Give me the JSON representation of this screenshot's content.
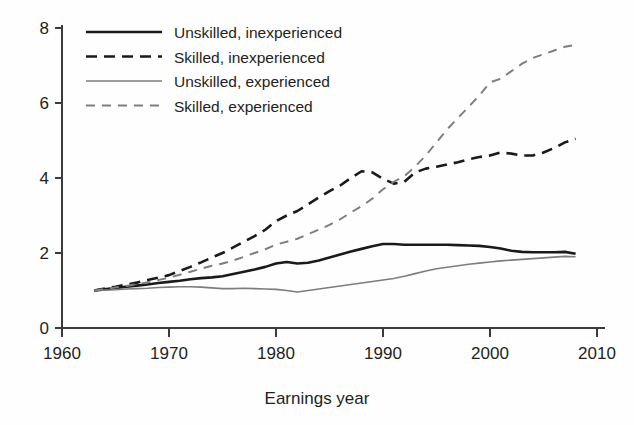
{
  "chart_data": {
    "type": "line",
    "title": "",
    "subtitle": "",
    "xlabel": "Earnings year",
    "ylabel": "",
    "xlim": [
      1960,
      2010
    ],
    "ylim": [
      0,
      8
    ],
    "xticks": [
      1960,
      1970,
      1980,
      1990,
      2000,
      2010
    ],
    "yticks": [
      0,
      2,
      4,
      6,
      8
    ],
    "xtick_labels": [
      "1960",
      "1970",
      "1980",
      "1990",
      "2000",
      "2010"
    ],
    "ytick_labels": [
      "0",
      "2",
      "4",
      "6",
      "8"
    ],
    "grid": false,
    "legend_position": "top-left",
    "annotations": [],
    "series": [
      {
        "name": "Unskilled, inexperienced",
        "color": "#1a1a1a",
        "width": 2.6,
        "dash": "none",
        "x": [
          1963,
          1964,
          1965,
          1966,
          1967,
          1968,
          1969,
          1970,
          1971,
          1972,
          1973,
          1974,
          1975,
          1976,
          1977,
          1978,
          1979,
          1980,
          1981,
          1982,
          1983,
          1984,
          1985,
          1986,
          1987,
          1988,
          1989,
          1990,
          1991,
          1992,
          1993,
          1994,
          1995,
          1996,
          1997,
          1998,
          1999,
          2000,
          2001,
          2002,
          2003,
          2004,
          2005,
          2006,
          2007,
          2008
        ],
        "values": [
          1.0,
          1.03,
          1.07,
          1.1,
          1.13,
          1.16,
          1.2,
          1.23,
          1.26,
          1.3,
          1.33,
          1.35,
          1.38,
          1.44,
          1.5,
          1.56,
          1.63,
          1.72,
          1.76,
          1.72,
          1.74,
          1.8,
          1.88,
          1.96,
          2.04,
          2.11,
          2.18,
          2.24,
          2.24,
          2.22,
          2.22,
          2.22,
          2.22,
          2.22,
          2.21,
          2.2,
          2.19,
          2.16,
          2.12,
          2.06,
          2.03,
          2.02,
          2.02,
          2.02,
          2.03,
          1.98
        ]
      },
      {
        "name": "Skilled, inexperienced",
        "color": "#1a1a1a",
        "width": 2.6,
        "dash": "11,7",
        "x": [
          1963,
          1964,
          1965,
          1966,
          1967,
          1968,
          1969,
          1970,
          1971,
          1972,
          1973,
          1974,
          1975,
          1976,
          1977,
          1978,
          1979,
          1980,
          1981,
          1982,
          1983,
          1984,
          1985,
          1986,
          1987,
          1988,
          1989,
          1990,
          1991,
          1992,
          1993,
          1994,
          1995,
          1996,
          1997,
          1998,
          1999,
          2000,
          2001,
          2002,
          2003,
          2004,
          2005,
          2006,
          2007,
          2008
        ],
        "values": [
          1.0,
          1.05,
          1.1,
          1.16,
          1.21,
          1.28,
          1.34,
          1.41,
          1.52,
          1.63,
          1.75,
          1.88,
          2.0,
          2.15,
          2.3,
          2.45,
          2.62,
          2.85,
          3.0,
          3.12,
          3.3,
          3.48,
          3.65,
          3.8,
          4.0,
          4.18,
          4.15,
          3.98,
          3.85,
          3.9,
          4.15,
          4.25,
          4.3,
          4.36,
          4.42,
          4.5,
          4.56,
          4.6,
          4.68,
          4.65,
          4.6,
          4.6,
          4.68,
          4.8,
          4.95,
          5.05
        ]
      },
      {
        "name": "Unskilled, experienced",
        "color": "#7d7d7d",
        "width": 1.6,
        "dash": "none",
        "x": [
          1963,
          1964,
          1965,
          1966,
          1967,
          1968,
          1969,
          1970,
          1971,
          1972,
          1973,
          1974,
          1975,
          1976,
          1977,
          1978,
          1979,
          1980,
          1981,
          1982,
          1983,
          1984,
          1985,
          1986,
          1987,
          1988,
          1989,
          1990,
          1991,
          1992,
          1993,
          1994,
          1995,
          1996,
          1997,
          1998,
          1999,
          2000,
          2001,
          2002,
          2003,
          2004,
          2005,
          2006,
          2007,
          2008
        ],
        "values": [
          1.0,
          1.01,
          1.02,
          1.04,
          1.05,
          1.06,
          1.08,
          1.09,
          1.1,
          1.1,
          1.09,
          1.07,
          1.05,
          1.05,
          1.06,
          1.05,
          1.04,
          1.03,
          1.0,
          0.96,
          1.0,
          1.04,
          1.08,
          1.12,
          1.16,
          1.2,
          1.24,
          1.28,
          1.32,
          1.38,
          1.45,
          1.52,
          1.58,
          1.62,
          1.66,
          1.7,
          1.73,
          1.76,
          1.79,
          1.81,
          1.83,
          1.85,
          1.87,
          1.89,
          1.91,
          1.9
        ]
      },
      {
        "name": "Skilled, experienced",
        "color": "#7d7d7d",
        "width": 1.9,
        "dash": "9,7",
        "x": [
          1963,
          1964,
          1965,
          1966,
          1967,
          1968,
          1969,
          1970,
          1971,
          1972,
          1973,
          1974,
          1975,
          1976,
          1977,
          1978,
          1979,
          1980,
          1981,
          1982,
          1983,
          1984,
          1985,
          1986,
          1987,
          1988,
          1989,
          1990,
          1991,
          1992,
          1993,
          1994,
          1995,
          1996,
          1997,
          1998,
          1999,
          2000,
          2001,
          2002,
          2003,
          2004,
          2005,
          2006,
          2007,
          2008
        ],
        "values": [
          1.0,
          1.04,
          1.08,
          1.12,
          1.17,
          1.22,
          1.28,
          1.34,
          1.42,
          1.5,
          1.58,
          1.66,
          1.72,
          1.8,
          1.9,
          2.0,
          2.1,
          2.22,
          2.3,
          2.38,
          2.5,
          2.62,
          2.75,
          2.9,
          3.08,
          3.25,
          3.45,
          3.7,
          3.9,
          4.05,
          4.3,
          4.6,
          4.95,
          5.3,
          5.6,
          5.9,
          6.2,
          6.55,
          6.65,
          6.85,
          7.05,
          7.2,
          7.3,
          7.4,
          7.5,
          7.55
        ]
      }
    ]
  },
  "legend": {
    "entries": [
      {
        "label": "Unskilled, inexperienced"
      },
      {
        "label": "Skilled, inexperienced"
      },
      {
        "label": "Unskilled, experienced"
      },
      {
        "label": "Skilled, experienced"
      }
    ]
  },
  "colors": {
    "dark_series": "#1a1a1a",
    "light_series": "#7d7d7d",
    "axis": "#3b3b3b",
    "text": "#231f20",
    "background": "#fefefe"
  }
}
